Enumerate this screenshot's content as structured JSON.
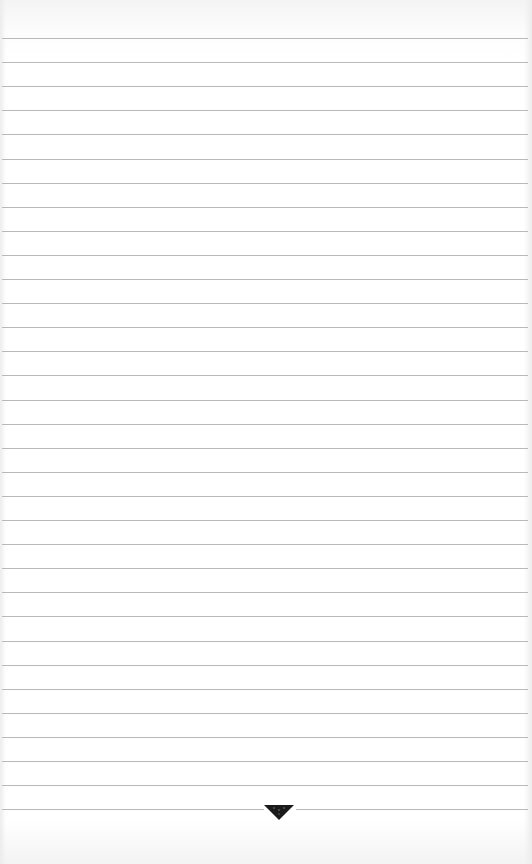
{
  "page": {
    "type": "lined-notepad-page",
    "background_color": "#ffffff",
    "rule_color": "#b9b9b9",
    "rule_count": 33,
    "first_rule_y": 38,
    "rule_spacing_px": 24.1,
    "ornament": {
      "icon": "inverted-triangle-ornament-icon",
      "color": "#1a1a1a",
      "position": "bottom-center on last rule"
    },
    "text_content": ""
  }
}
